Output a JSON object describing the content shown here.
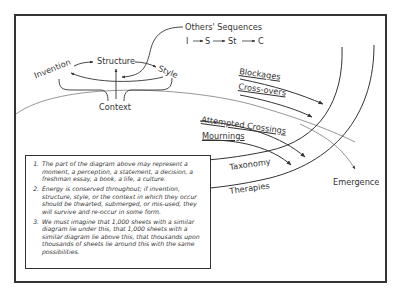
{
  "diagram": {
    "cycle": {
      "invention": "Invention",
      "structure": "Structure",
      "style": "Style",
      "context": "Context"
    },
    "others_sequences": {
      "title": "Others' Sequences",
      "sequence": [
        "I",
        "S",
        "St",
        "C"
      ]
    },
    "flows": {
      "blockages": "Blockages",
      "cross_overs": "Cross-overs",
      "attempted_crossings": "Attempted Crossings",
      "mournings": "Mournings",
      "taxonomy": "Taxonomy",
      "therapies": "Therapies",
      "emergence": "Emergence"
    },
    "notes": [
      "The part of the diagram above may represent a moment, a perception, a statement, a decision, a freshman essay, a book, a life, a culture.",
      "Energy is conserved throughout; if invention, structure, style, or the context in which they occur should be thwarted, submerged, or mis-used, they will survive and re-occur in some form.",
      "We must imagine that 1,000 sheets with a similar diagram lie under this, that 1,000 sheets with a similar diagram lie above this, that thousands upon thousands of sheets lie around this with the same possibilities."
    ],
    "colors": {
      "ink": "#333333",
      "horizon": "#8a8a8a",
      "background": "#ffffff"
    }
  }
}
